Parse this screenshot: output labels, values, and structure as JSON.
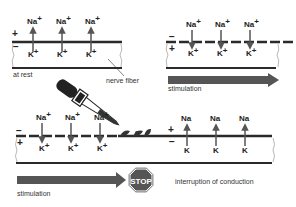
{
  "panels": {
    "at_rest": {
      "label": "at rest",
      "outer_sign": "+",
      "inner_sign": "−",
      "ions": [
        {
          "top": "Na",
          "top_sup": "+",
          "bottom": "K",
          "bottom_sup": "+",
          "direction": "up"
        },
        {
          "top": "Na",
          "top_sup": "+",
          "bottom": "K",
          "bottom_sup": "+",
          "direction": "up"
        },
        {
          "top": "Na",
          "top_sup": "+",
          "bottom": "K",
          "bottom_sup": "+",
          "direction": "up"
        }
      ]
    },
    "stimulated": {
      "label": "stimulation",
      "outer_sign": "−",
      "inner_sign": "+",
      "ions": [
        {
          "top": "Na",
          "top_sup": "+",
          "bottom": "K",
          "bottom_sup": "+",
          "direction": "down"
        },
        {
          "top": "Na",
          "top_sup": "+",
          "bottom": "K",
          "bottom_sup": "+",
          "direction": "down"
        },
        {
          "top": "Na",
          "top_sup": "+",
          "bottom": "K",
          "bottom_sup": "+",
          "direction": "down"
        }
      ]
    },
    "interrupted": {
      "stimulation_label": "stimulation",
      "stop_label": "STOP",
      "result_label": "interruption of conduction",
      "left_outer_sign": "−",
      "left_inner_sign": "+",
      "right_outer_sign": "+",
      "right_inner_sign": "−",
      "left_ions": [
        {
          "top": "Na",
          "top_sup": "+",
          "bottom": "K",
          "bottom_sup": "+",
          "direction": "down"
        },
        {
          "top": "Na",
          "top_sup": "+",
          "bottom": "K",
          "bottom_sup": "+",
          "direction": "down"
        },
        {
          "top": "Na",
          "top_sup": "+",
          "bottom": "K",
          "bottom_sup": "+",
          "direction": "down"
        }
      ],
      "right_ions": [
        {
          "top": "Na",
          "bottom": "K",
          "direction": "up"
        },
        {
          "top": "Na",
          "bottom": "K",
          "direction": "up"
        },
        {
          "top": "Na",
          "bottom": "K",
          "direction": "up"
        }
      ]
    }
  },
  "annotations": {
    "nerve_fiber": "nerve fiber"
  },
  "colors": {
    "arrow": "#555555",
    "membrane": "#2a2a2a",
    "stop_fill": "#555555",
    "dropper": "#222222"
  }
}
